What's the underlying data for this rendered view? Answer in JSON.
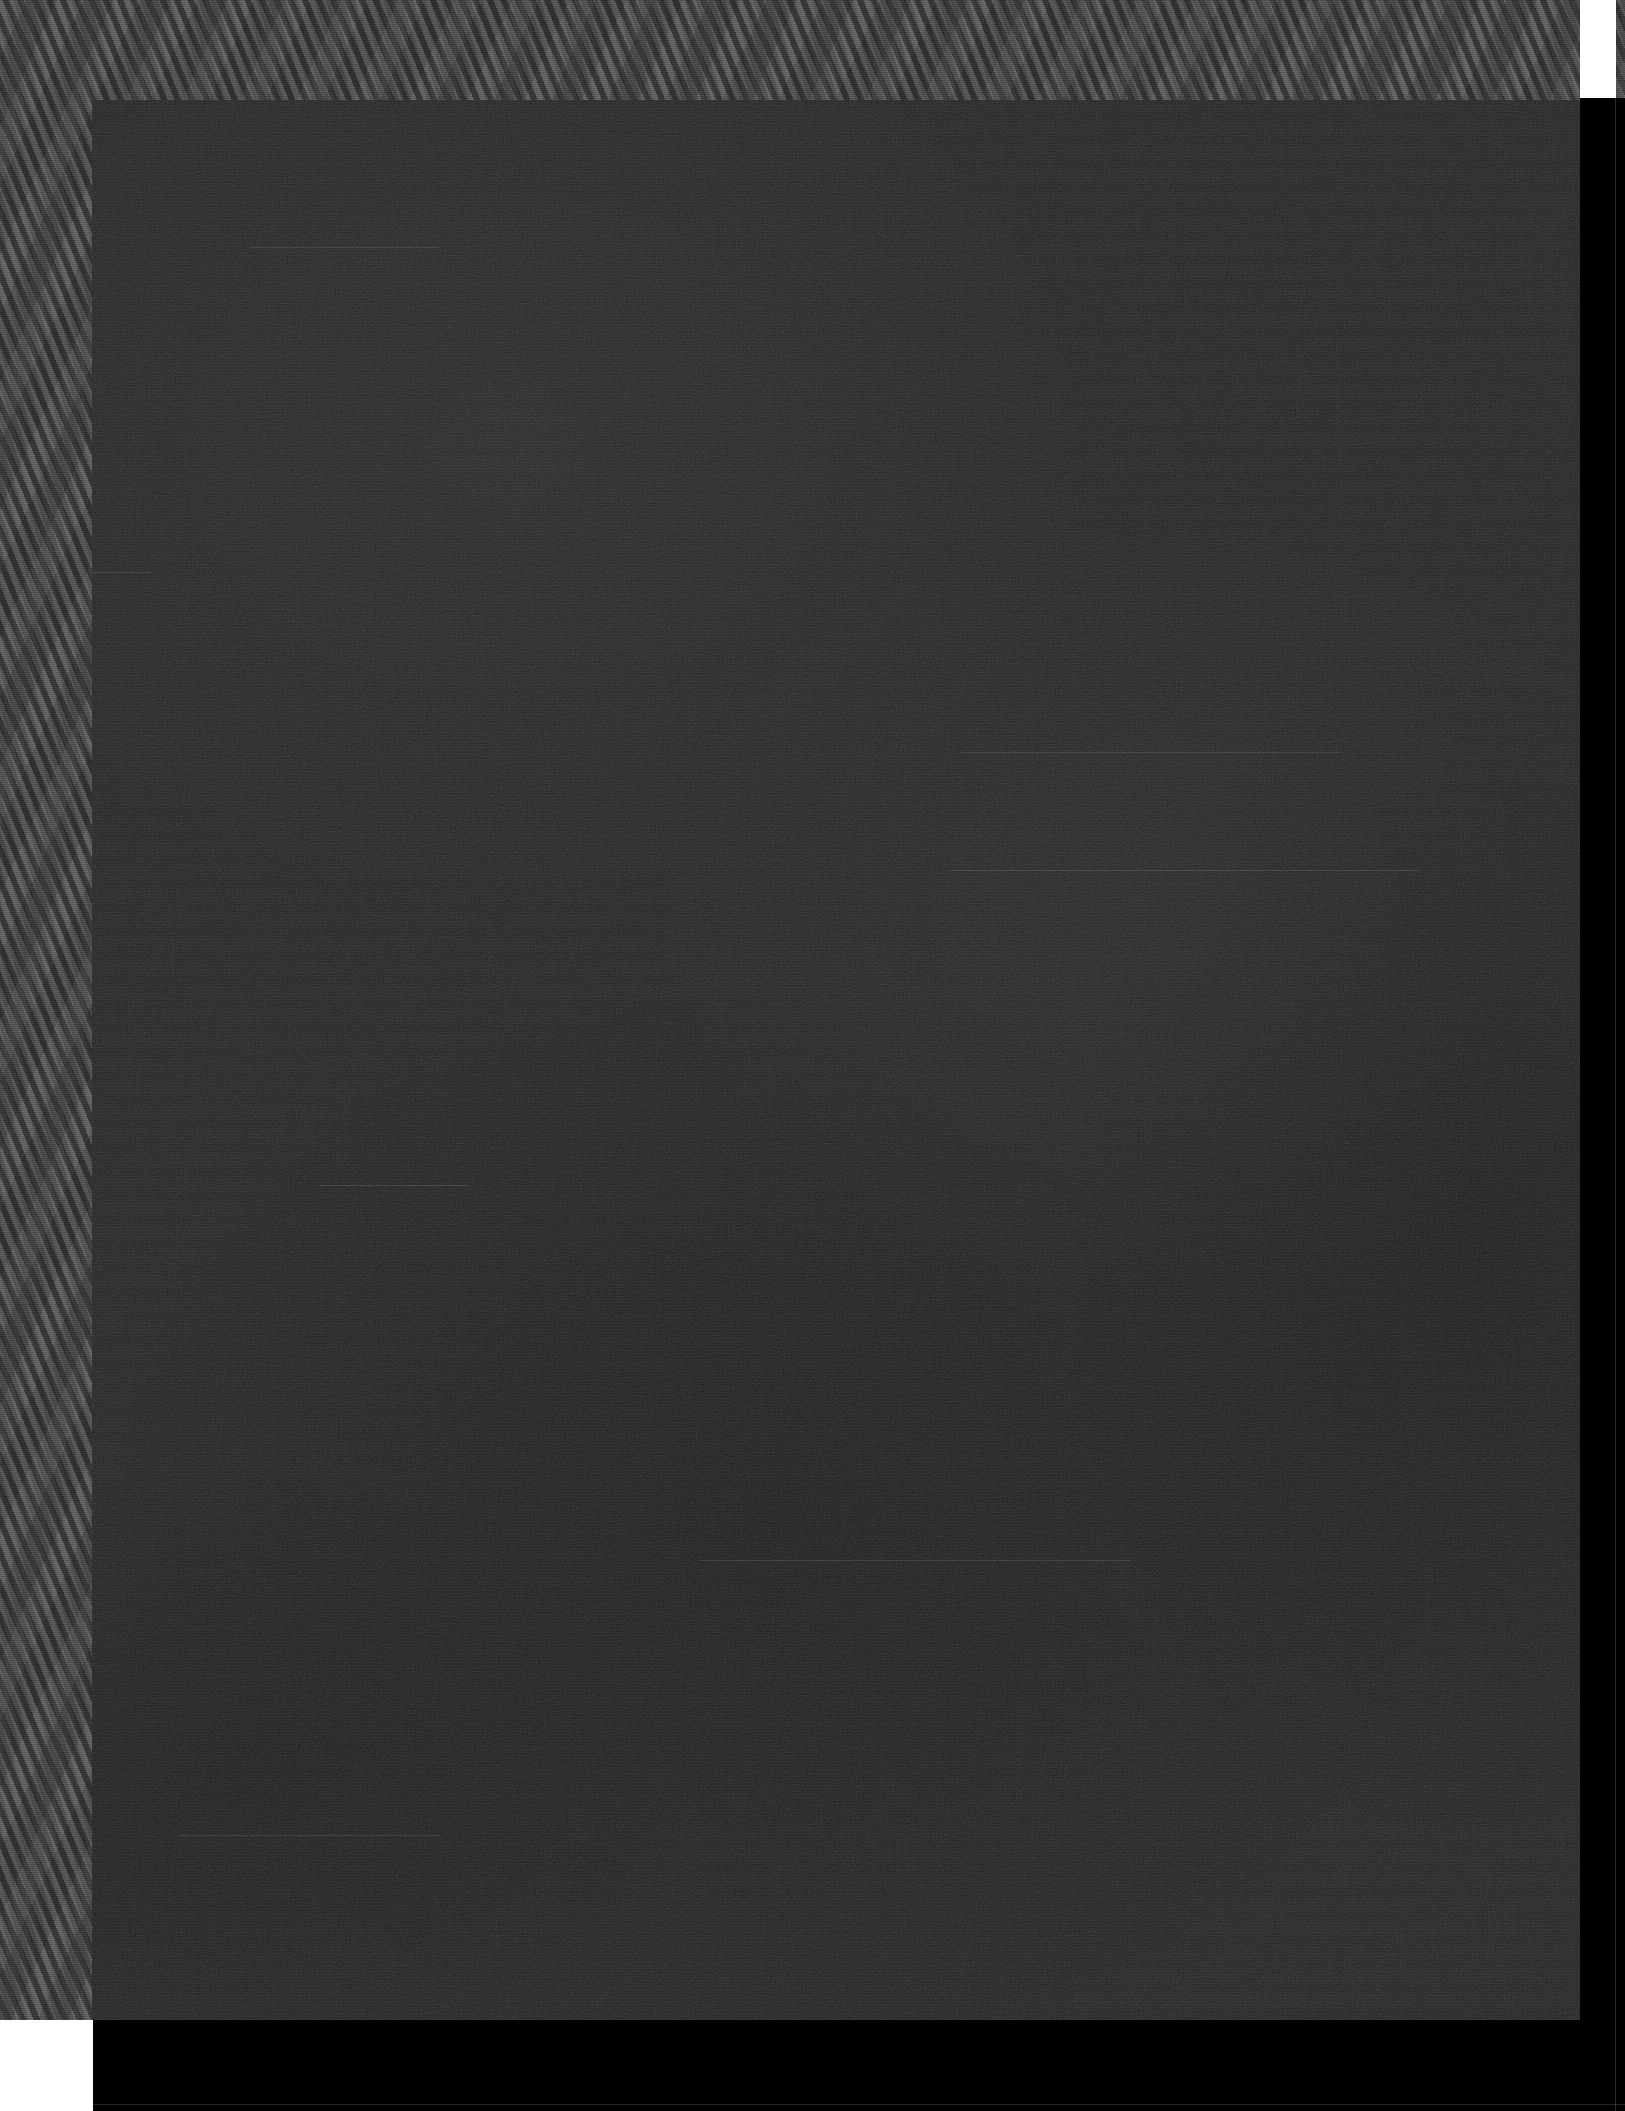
{
  "document": {
    "kind": "scanned-page",
    "state": "underexposed-blank",
    "width": 1625,
    "height": 2111,
    "visible_text": "",
    "note": "No legible text, glyphs, figures or captions are rendered in the pixels."
  },
  "colors": {
    "border_moire": "#565656",
    "scan_body": "#232323",
    "registration_white": "#ffffff",
    "edge_black": "#000000"
  },
  "regions": [
    {
      "name": "moire-border-frame",
      "label": "halftone scanner border",
      "x": 0,
      "y": 0,
      "width": 1625,
      "height": 2111,
      "fill": "#565656"
    },
    {
      "name": "scan-body",
      "label": "dark page field",
      "x": 92,
      "y": 100,
      "width": 1488,
      "height": 1920,
      "fill": "#232323"
    },
    {
      "name": "registration-block-top-right",
      "label": "white registration block",
      "x": 1580,
      "y": 0,
      "width": 36,
      "height": 98,
      "fill": "#ffffff"
    },
    {
      "name": "registration-block-bottom-left",
      "label": "white registration block",
      "x": 0,
      "y": 2020,
      "width": 93,
      "height": 91,
      "fill": "#ffffff"
    },
    {
      "name": "edge-band-right",
      "label": "black right edge band",
      "x": 1580,
      "y": 98,
      "width": 45,
      "height": 2013,
      "fill": "#000000"
    },
    {
      "name": "edge-band-bottom",
      "label": "black bottom edge band",
      "x": 93,
      "y": 2020,
      "width": 1532,
      "height": 91,
      "fill": "#000000"
    }
  ],
  "artifacts": {
    "streaks": [
      {
        "x": 250,
        "y": 247,
        "width": 190
      },
      {
        "x": 20,
        "y": 572,
        "width": 60
      },
      {
        "x": 960,
        "y": 752,
        "width": 380
      },
      {
        "x": 950,
        "y": 870,
        "width": 470
      },
      {
        "x": 320,
        "y": 1185,
        "width": 150
      },
      {
        "x": 700,
        "y": 1560,
        "width": 430
      },
      {
        "x": 180,
        "y": 1835,
        "width": 260
      }
    ],
    "hairlines": {
      "right_vertical_x": 1615,
      "bottom_horizontal_y": 2104
    }
  }
}
